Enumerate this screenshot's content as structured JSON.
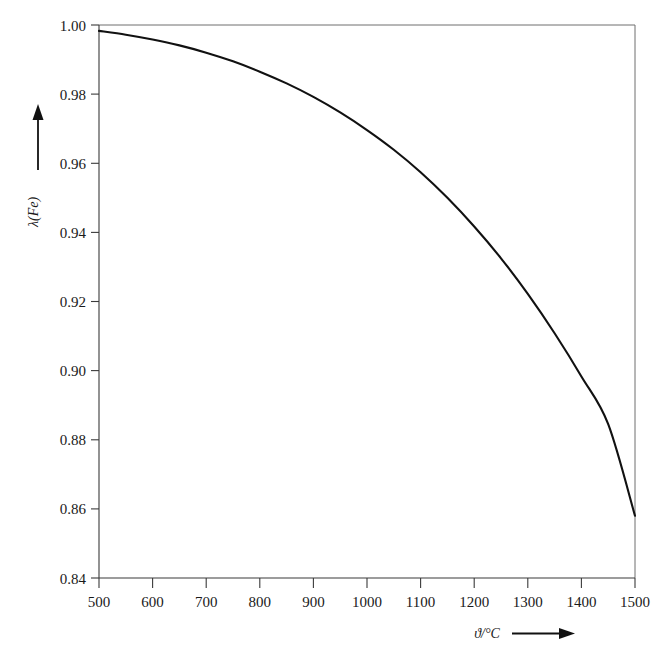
{
  "chart_data": {
    "type": "line",
    "title": "",
    "subtitle": "",
    "xlabel": "ϑ/°C",
    "ylabel": "λ(Fe)",
    "xlim": [
      500,
      1500
    ],
    "ylim": [
      0.84,
      1.0
    ],
    "grid": false,
    "legend": null,
    "x_ticks": [
      500,
      600,
      700,
      800,
      900,
      1000,
      1100,
      1200,
      1300,
      1400,
      1500
    ],
    "x_tick_labels": [
      "500",
      "600",
      "700",
      "800",
      "900",
      "1000",
      "1100",
      "1200",
      "1300",
      "1400",
      "1500"
    ],
    "y_ticks": [
      0.84,
      0.86,
      0.88,
      0.9,
      0.92,
      0.94,
      0.96,
      0.98,
      1.0
    ],
    "y_tick_labels": [
      "0.84",
      "0.86",
      "0.88",
      "0.90",
      "0.92",
      "0.94",
      "0.96",
      "0.98",
      "1.00"
    ],
    "x": [
      500,
      550,
      600,
      650,
      700,
      750,
      800,
      850,
      900,
      950,
      1000,
      1050,
      1100,
      1150,
      1200,
      1250,
      1300,
      1350,
      1400,
      1450,
      1500
    ],
    "series": [
      {
        "name": "λ(Fe)",
        "color": "#111111",
        "values": [
          0.9983,
          0.9972,
          0.9958,
          0.9941,
          0.992,
          0.9895,
          0.9865,
          0.9831,
          0.9792,
          0.9747,
          0.9696,
          0.9639,
          0.9574,
          0.95,
          0.9417,
          0.9325,
          0.9222,
          0.9108,
          0.8983,
          0.8845,
          0.858
        ]
      }
    ],
    "annotations": []
  },
  "axes": {
    "y_axis_arrow": "upward-arrow",
    "x_axis_arrow": "rightward-arrow"
  },
  "colors": {
    "curve": "#111111",
    "axis": "#3a3a3a",
    "frame": "#6e6e6e",
    "text": "#1a1a1a",
    "background": "#ffffff"
  }
}
